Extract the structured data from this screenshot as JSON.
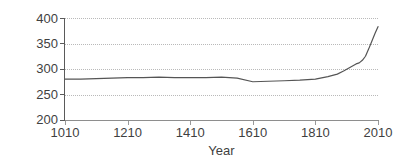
{
  "chart_data": {
    "type": "line",
    "title": "",
    "xlabel": "Year",
    "ylabel": "CO2 (ppm)",
    "ylabel_base": "CO",
    "ylabel_sub": "2",
    "ylabel_unit": " (ppm)",
    "xlim": [
      1010,
      2010
    ],
    "ylim": [
      200,
      400
    ],
    "grid": true,
    "legend": "none",
    "line_color": "#555555",
    "xticks": [
      1010,
      1210,
      1410,
      1610,
      1810,
      2010
    ],
    "xtick_labels": [
      "1010",
      "1210",
      "1410",
      "1610",
      "1810",
      "2010"
    ],
    "yticks": [
      200,
      250,
      300,
      350,
      400
    ],
    "ytick_labels": [
      "200",
      "250",
      "300",
      "350",
      "400"
    ],
    "series": [
      {
        "name": "Atmospheric CO2",
        "x": [
          1010,
          1060,
          1110,
          1160,
          1210,
          1260,
          1310,
          1360,
          1410,
          1460,
          1510,
          1560,
          1610,
          1660,
          1710,
          1760,
          1810,
          1850,
          1880,
          1900,
          1920,
          1940,
          1950,
          1960,
          1970,
          1980,
          1990,
          2000,
          2010
        ],
        "values": [
          280,
          280,
          281,
          282,
          283,
          283,
          284,
          283,
          283,
          283,
          284,
          282,
          275,
          276,
          277,
          278,
          280,
          285,
          290,
          296,
          303,
          310,
          312,
          317,
          325,
          339,
          354,
          369,
          383
        ]
      }
    ]
  }
}
